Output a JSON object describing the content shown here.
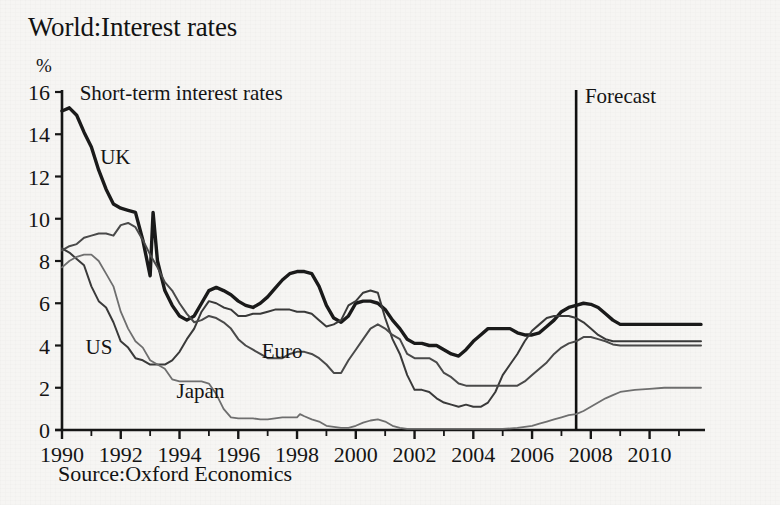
{
  "header": {
    "title": "World:Interest rates"
  },
  "footer": {
    "source": "Source:Oxford Economics"
  },
  "annotations": {
    "plot_note": "Short-term interest rates",
    "forecast_label": "Forecast",
    "forecast_x": 2007.5
  },
  "axes": {
    "y_unit": "%",
    "y_ticks": [
      "0",
      "2",
      "4",
      "6",
      "8",
      "10",
      "12",
      "14",
      "16"
    ],
    "x_ticks": [
      "1990",
      "1992",
      "1994",
      "1996",
      "1998",
      "2000",
      "2002",
      "2004",
      "2006",
      "2008",
      "2010"
    ]
  },
  "colors": {
    "uk": "#1a1a1a",
    "us": "#3a3a3a",
    "euro": "#4a4a4a",
    "japan": "#6f6f6f",
    "axis": "#161616",
    "forecast_rule": "#101010",
    "background": "#f6f5f3"
  },
  "chart_data": {
    "type": "line",
    "title": "World:Interest rates",
    "subtitle": "Short-term interest rates",
    "xlabel": "",
    "ylabel": "%",
    "xlim": [
      1990,
      2011.75
    ],
    "ylim": [
      0,
      16
    ],
    "grid": false,
    "legend": "inline-labels",
    "y_ticks": [
      0,
      2,
      4,
      6,
      8,
      10,
      12,
      14,
      16
    ],
    "x_ticks": [
      1990,
      1992,
      1994,
      1996,
      1998,
      2000,
      2002,
      2004,
      2006,
      2008,
      2010
    ],
    "x_minor_tick_step": 1,
    "forecast_start": 2007.5,
    "annotations": [
      {
        "text": "Short-term interest rates",
        "x": 1990.6,
        "y": 15.6
      },
      {
        "text": "Forecast",
        "x": 2007.8,
        "y": 15.5
      },
      {
        "text": "UK",
        "x": 1991.3,
        "y": 12.6
      },
      {
        "text": "US",
        "x": 1990.8,
        "y": 3.6
      },
      {
        "text": "Euro",
        "x": 1996.8,
        "y": 3.4
      },
      {
        "text": "Japan",
        "x": 1993.9,
        "y": 1.5
      }
    ],
    "series": [
      {
        "name": "UK",
        "color": "#1a1a1a",
        "width": 3.4,
        "x": [
          1990.0,
          1990.25,
          1990.5,
          1990.75,
          1991.0,
          1991.25,
          1991.5,
          1991.75,
          1992.0,
          1992.25,
          1992.5,
          1992.75,
          1993.0,
          1993.1,
          1993.25,
          1993.5,
          1993.75,
          1994.0,
          1994.25,
          1994.5,
          1994.75,
          1995.0,
          1995.25,
          1995.5,
          1995.75,
          1996.0,
          1996.25,
          1996.5,
          1996.75,
          1997.0,
          1997.25,
          1997.5,
          1997.75,
          1998.0,
          1998.25,
          1998.5,
          1998.75,
          1999.0,
          1999.25,
          1999.5,
          1999.75,
          2000.0,
          2000.25,
          2000.5,
          2000.75,
          2001.0,
          2001.25,
          2001.5,
          2001.75,
          2002.0,
          2002.25,
          2002.5,
          2002.75,
          2003.0,
          2003.25,
          2003.5,
          2003.75,
          2004.0,
          2004.25,
          2004.5,
          2004.75,
          2005.0,
          2005.25,
          2005.5,
          2005.75,
          2006.0,
          2006.25,
          2006.5,
          2006.75,
          2007.0,
          2007.25,
          2007.5,
          2007.75,
          2008.0,
          2008.25,
          2008.5,
          2008.75,
          2009.0,
          2009.5,
          2010.0,
          2010.5,
          2011.0,
          2011.75
        ],
        "y": [
          15.1,
          15.25,
          14.9,
          14.1,
          13.4,
          12.3,
          11.4,
          10.7,
          10.5,
          10.4,
          10.3,
          9.0,
          7.3,
          10.3,
          8.0,
          6.6,
          5.9,
          5.4,
          5.2,
          5.4,
          6.0,
          6.6,
          6.75,
          6.6,
          6.4,
          6.1,
          5.9,
          5.8,
          6.0,
          6.3,
          6.7,
          7.1,
          7.4,
          7.5,
          7.5,
          7.4,
          6.8,
          5.9,
          5.3,
          5.1,
          5.4,
          6.0,
          6.1,
          6.1,
          6.0,
          5.7,
          5.2,
          4.8,
          4.3,
          4.1,
          4.1,
          4.0,
          4.0,
          3.8,
          3.6,
          3.5,
          3.8,
          4.2,
          4.5,
          4.8,
          4.8,
          4.8,
          4.8,
          4.6,
          4.5,
          4.5,
          4.6,
          4.9,
          5.2,
          5.6,
          5.8,
          5.9,
          6.0,
          5.95,
          5.8,
          5.5,
          5.2,
          5.0,
          5.0,
          5.0,
          5.0,
          5.0,
          5.0
        ]
      },
      {
        "name": "US",
        "color": "#3a3a3a",
        "width": 2.0,
        "x": [
          1990.0,
          1990.25,
          1990.5,
          1990.75,
          1991.0,
          1991.25,
          1991.5,
          1991.75,
          1992.0,
          1992.25,
          1992.5,
          1992.75,
          1993.0,
          1993.25,
          1993.5,
          1993.75,
          1994.0,
          1994.25,
          1994.5,
          1994.75,
          1995.0,
          1995.25,
          1995.5,
          1995.75,
          1996.0,
          1996.25,
          1996.5,
          1996.75,
          1997.0,
          1997.25,
          1997.5,
          1997.75,
          1998.0,
          1998.25,
          1998.5,
          1998.75,
          1999.0,
          1999.25,
          1999.5,
          1999.75,
          2000.0,
          2000.25,
          2000.5,
          2000.75,
          2001.0,
          2001.25,
          2001.5,
          2001.75,
          2002.0,
          2002.25,
          2002.5,
          2002.75,
          2003.0,
          2003.25,
          2003.5,
          2003.75,
          2004.0,
          2004.25,
          2004.5,
          2004.75,
          2005.0,
          2005.25,
          2005.5,
          2005.75,
          2006.0,
          2006.25,
          2006.5,
          2006.75,
          2007.0,
          2007.25,
          2007.5,
          2007.75,
          2008.0,
          2008.25,
          2008.5,
          2008.75,
          2009.0,
          2009.5,
          2010.0,
          2010.5,
          2011.0,
          2011.75
        ],
        "y": [
          8.6,
          8.4,
          8.1,
          7.8,
          6.8,
          6.1,
          5.8,
          5.1,
          4.2,
          3.9,
          3.4,
          3.3,
          3.1,
          3.1,
          3.1,
          3.3,
          3.7,
          4.3,
          4.8,
          5.6,
          6.1,
          6.0,
          5.8,
          5.7,
          5.4,
          5.4,
          5.5,
          5.5,
          5.6,
          5.7,
          5.7,
          5.7,
          5.6,
          5.6,
          5.5,
          5.2,
          4.9,
          5.0,
          5.2,
          5.9,
          6.1,
          6.5,
          6.6,
          6.5,
          5.3,
          4.3,
          3.6,
          2.6,
          1.9,
          1.9,
          1.8,
          1.5,
          1.3,
          1.2,
          1.1,
          1.2,
          1.1,
          1.1,
          1.3,
          1.8,
          2.6,
          3.1,
          3.6,
          4.2,
          4.7,
          5.0,
          5.3,
          5.4,
          5.4,
          5.4,
          5.3,
          5.1,
          4.8,
          4.5,
          4.3,
          4.2,
          4.2,
          4.2,
          4.2,
          4.2,
          4.2,
          4.2
        ]
      },
      {
        "name": "Euro",
        "color": "#4a4a4a",
        "width": 2.0,
        "x": [
          1990.0,
          1990.25,
          1990.5,
          1990.75,
          1991.0,
          1991.25,
          1991.5,
          1991.75,
          1992.0,
          1992.25,
          1992.5,
          1992.75,
          1993.0,
          1993.25,
          1993.5,
          1993.75,
          1994.0,
          1994.25,
          1994.5,
          1994.75,
          1995.0,
          1995.25,
          1995.5,
          1995.75,
          1996.0,
          1996.25,
          1996.5,
          1996.75,
          1997.0,
          1997.25,
          1997.5,
          1997.75,
          1998.0,
          1998.25,
          1998.5,
          1998.75,
          1999.0,
          1999.25,
          1999.5,
          1999.75,
          2000.0,
          2000.25,
          2000.5,
          2000.75,
          2001.0,
          2001.25,
          2001.5,
          2001.75,
          2002.0,
          2002.25,
          2002.5,
          2002.75,
          2003.0,
          2003.25,
          2003.5,
          2003.75,
          2004.0,
          2004.25,
          2004.5,
          2004.75,
          2005.0,
          2005.25,
          2005.5,
          2005.75,
          2006.0,
          2006.25,
          2006.5,
          2006.75,
          2007.0,
          2007.25,
          2007.5,
          2007.75,
          2008.0,
          2008.25,
          2008.5,
          2008.75,
          2009.0,
          2009.5,
          2010.0,
          2010.5,
          2011.0,
          2011.75
        ],
        "y": [
          8.5,
          8.7,
          8.8,
          9.1,
          9.2,
          9.3,
          9.3,
          9.2,
          9.7,
          9.8,
          9.6,
          9.0,
          8.3,
          7.7,
          7.0,
          6.6,
          6.0,
          5.5,
          5.1,
          5.2,
          5.4,
          5.3,
          5.1,
          4.8,
          4.3,
          4.0,
          3.8,
          3.6,
          3.4,
          3.4,
          3.4,
          3.6,
          3.7,
          3.7,
          3.6,
          3.4,
          3.1,
          2.7,
          2.7,
          3.3,
          3.8,
          4.3,
          4.8,
          5.0,
          4.8,
          4.5,
          4.3,
          3.6,
          3.4,
          3.4,
          3.4,
          3.2,
          2.7,
          2.5,
          2.2,
          2.1,
          2.1,
          2.1,
          2.1,
          2.1,
          2.1,
          2.1,
          2.1,
          2.3,
          2.6,
          2.9,
          3.2,
          3.6,
          3.9,
          4.1,
          4.2,
          4.4,
          4.4,
          4.3,
          4.2,
          4.05,
          4.0,
          4.0,
          4.0,
          4.0,
          4.0,
          4.0
        ]
      },
      {
        "name": "Japan",
        "color": "#6f6f6f",
        "width": 1.8,
        "x": [
          1990.0,
          1990.25,
          1990.5,
          1990.75,
          1991.0,
          1991.25,
          1991.5,
          1991.75,
          1992.0,
          1992.25,
          1992.5,
          1992.75,
          1993.0,
          1993.25,
          1993.5,
          1993.75,
          1994.0,
          1994.25,
          1994.5,
          1994.75,
          1995.0,
          1995.25,
          1995.5,
          1995.75,
          1996.0,
          1996.25,
          1996.5,
          1996.75,
          1997.0,
          1997.25,
          1997.5,
          1997.75,
          1998.0,
          1998.1,
          1998.25,
          1998.5,
          1998.75,
          1999.0,
          1999.25,
          1999.5,
          1999.75,
          2000.0,
          2000.25,
          2000.5,
          2000.75,
          2001.0,
          2001.25,
          2001.5,
          2001.75,
          2002.0,
          2002.5,
          2003.0,
          2003.5,
          2004.0,
          2004.5,
          2005.0,
          2005.5,
          2006.0,
          2006.25,
          2006.5,
          2006.75,
          2007.0,
          2007.25,
          2007.5,
          2007.75,
          2008.0,
          2008.25,
          2008.5,
          2008.75,
          2009.0,
          2009.5,
          2010.0,
          2010.5,
          2011.0,
          2011.75
        ],
        "y": [
          7.7,
          8.0,
          8.2,
          8.3,
          8.3,
          8.0,
          7.4,
          6.8,
          5.6,
          4.8,
          4.2,
          3.9,
          3.3,
          3.1,
          2.9,
          2.4,
          2.3,
          2.3,
          2.3,
          2.3,
          2.2,
          1.7,
          1.0,
          0.6,
          0.55,
          0.55,
          0.55,
          0.5,
          0.5,
          0.55,
          0.6,
          0.6,
          0.6,
          0.75,
          0.65,
          0.5,
          0.4,
          0.2,
          0.15,
          0.1,
          0.1,
          0.2,
          0.35,
          0.45,
          0.5,
          0.4,
          0.2,
          0.1,
          0.05,
          0.05,
          0.05,
          0.05,
          0.05,
          0.05,
          0.05,
          0.05,
          0.1,
          0.2,
          0.3,
          0.4,
          0.5,
          0.6,
          0.7,
          0.75,
          0.9,
          1.1,
          1.3,
          1.5,
          1.65,
          1.8,
          1.9,
          1.95,
          2.0,
          2.0,
          2.0
        ]
      }
    ]
  }
}
